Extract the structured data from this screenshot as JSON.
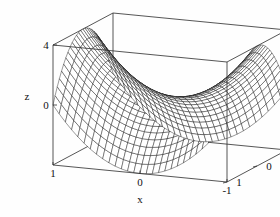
{
  "figure": {
    "title": "",
    "background_color": "#fefefe",
    "line_color": "#2b2b2b",
    "mesh_color": "#000000",
    "width": 280,
    "height": 217
  },
  "chart_data": {
    "type": "surface3d",
    "title": "",
    "subtitle": "",
    "surface_expression": "z = a*x^2 - b*y^2",
    "surface_kind": "hyperbolic-paraboloid-saddle",
    "coefficients": {
      "a": 4,
      "b": 4
    },
    "xlabel": "x",
    "ylabel": "y",
    "zlabel": "z",
    "xlim": [
      -1,
      1
    ],
    "ylim": [
      -1,
      1
    ],
    "zlim": [
      -4,
      4
    ],
    "x_ticks": [
      {
        "value": 1,
        "label": "1"
      },
      {
        "value": 0,
        "label": "0"
      },
      {
        "value": -1,
        "label": "-1"
      }
    ],
    "y_ticks": [
      {
        "value": -1,
        "label": "-1"
      },
      {
        "value": 0,
        "label": "0"
      },
      {
        "value": 1,
        "label": "1"
      }
    ],
    "z_ticks": [
      {
        "value": 4,
        "label": "4"
      },
      {
        "value": 0,
        "label": "0"
      }
    ],
    "mesh_divisions_u": 28,
    "mesh_divisions_v": 28,
    "grid": false,
    "legend": false,
    "box_frame": true,
    "wireframe": true,
    "shading": "white-faces-with-black-mesh",
    "view": {
      "azimuth_deg": 38,
      "elevation_deg": 22,
      "projection": "orthographic"
    },
    "x_values": [
      -1,
      -0.75,
      -0.5,
      -0.25,
      0,
      0.25,
      0.5,
      0.75,
      1
    ],
    "y_values": [
      -1,
      -0.75,
      -0.5,
      -0.25,
      0,
      0.25,
      0.5,
      0.75,
      1
    ],
    "z_matrix": [
      [
        0,
        1.75,
        3,
        3.75,
        4,
        3.75,
        3,
        1.75,
        0
      ],
      [
        -1.75,
        0,
        1.25,
        2,
        2.25,
        2,
        1.25,
        0,
        -1.75
      ],
      [
        -3,
        -1.25,
        0,
        0.75,
        1,
        0.75,
        0,
        -1.25,
        -3
      ],
      [
        -3.75,
        -2,
        -0.75,
        0,
        0.25,
        0,
        -0.75,
        -2,
        -3.75
      ],
      [
        -4,
        -2.25,
        -1,
        -0.25,
        0,
        -0.25,
        -1,
        -2.25,
        -4
      ],
      [
        -3.75,
        -2,
        -0.75,
        0,
        0.25,
        0,
        -0.75,
        -2,
        -3.75
      ],
      [
        -3,
        -1.25,
        0,
        0.75,
        1,
        0.75,
        0,
        -1.25,
        -3
      ],
      [
        -1.75,
        0,
        1.25,
        2,
        2.25,
        2,
        1.25,
        0,
        -1.75
      ],
      [
        0,
        1.75,
        3,
        3.75,
        4,
        3.75,
        3,
        1.75,
        0
      ]
    ]
  },
  "axes": {
    "x": {
      "label": "x"
    },
    "y": {
      "label": "y"
    },
    "z": {
      "label": "z"
    }
  }
}
